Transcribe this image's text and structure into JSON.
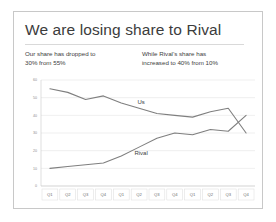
{
  "slide": {
    "title": "We are losing share to Rival",
    "subtitle_left": [
      "Our share has dropped to",
      "30% from 55% "
    ],
    "subtitle_right": [
      "While Rival’s share has",
      "increased to 40% from 10%"
    ]
  },
  "colors": {
    "title_text": "#3c3c3c",
    "body_text": "#404040",
    "line": "#7f7f7f",
    "gridline": "#dedede",
    "frame_border": "#c8c8c8",
    "axis_text": "#8c8c8c"
  },
  "chart_data": {
    "type": "line",
    "title": "",
    "xlabel": "",
    "ylabel": "",
    "ylim": [
      0,
      60
    ],
    "yticks": [
      0,
      10,
      20,
      30,
      40,
      50,
      60
    ],
    "ytick_labels": [
      "0",
      "10",
      "20",
      "30",
      "40",
      "50",
      "60"
    ],
    "grid": true,
    "legend": "inline-labels",
    "categories": [
      "Q1",
      "Q2",
      "Q3",
      "Q4",
      "Q1",
      "Q2",
      "Q3",
      "Q4",
      "Q1",
      "Q2",
      "Q3",
      "Q4"
    ],
    "series": [
      {
        "name": "Us",
        "label_position": "above-line",
        "values": [
          55,
          53,
          49,
          51,
          47,
          44,
          41,
          40,
          39,
          42,
          44,
          30
        ]
      },
      {
        "name": "Rival",
        "label_position": "below-line",
        "values": [
          10,
          11,
          12,
          13,
          17,
          22,
          27,
          30,
          29,
          32,
          31,
          40
        ]
      }
    ],
    "annotations": [
      {
        "text": "Us",
        "series": "Us"
      },
      {
        "text": "Rival",
        "series": "Rival"
      }
    ]
  }
}
